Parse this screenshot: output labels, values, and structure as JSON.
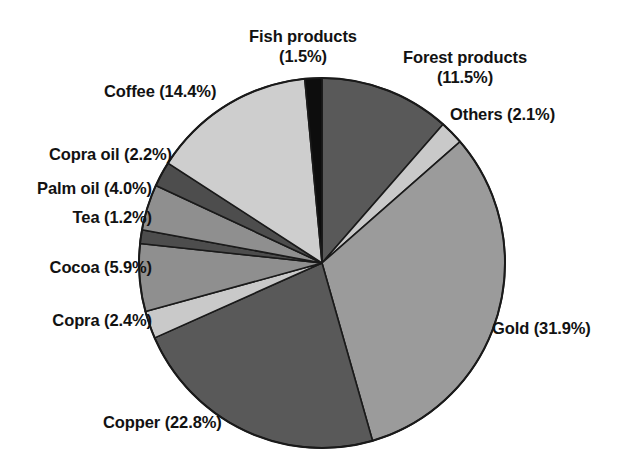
{
  "chart_data": {
    "type": "pie",
    "title": "",
    "subtitle": "",
    "xlabel": "",
    "ylabel": "",
    "legend_position": "none",
    "grid": false,
    "units": "percent",
    "start_angle_deg": 0,
    "direction": "clockwise",
    "categories": [
      "Forest products",
      "Others",
      "Gold",
      "Copper",
      "Copra",
      "Cocoa",
      "Tea",
      "Palm oil",
      "Copra oil",
      "Coffee",
      "Fish products"
    ],
    "values": [
      11.5,
      2.1,
      31.9,
      22.8,
      2.4,
      5.9,
      1.2,
      4.0,
      2.2,
      14.4,
      1.5
    ],
    "slices": [
      {
        "name": "Forest products",
        "value": 11.5,
        "label": "Forest products\n(11.5%)",
        "color": "#595959"
      },
      {
        "name": "Others",
        "value": 2.1,
        "label": "Others (2.1%)",
        "color": "#c9c9c9"
      },
      {
        "name": "Gold",
        "value": 31.9,
        "label": "Gold (31.9%)",
        "color": "#9b9b9b"
      },
      {
        "name": "Copper",
        "value": 22.8,
        "label": "Copper (22.8%)",
        "color": "#595959"
      },
      {
        "name": "Copra",
        "value": 2.4,
        "label": "Copra (2.4%)",
        "color": "#c9c9c9"
      },
      {
        "name": "Cocoa",
        "value": 5.9,
        "label": "Cocoa (5.9%)",
        "color": "#8f8f8f"
      },
      {
        "name": "Tea",
        "value": 1.2,
        "label": "Tea (1.2%)",
        "color": "#4d4d4d"
      },
      {
        "name": "Palm oil",
        "value": 4.0,
        "label": "Palm oil (4.0%)",
        "color": "#8f8f8f"
      },
      {
        "name": "Copra oil",
        "value": 2.2,
        "label": "Copra oil (2.2%)",
        "color": "#4d4d4d"
      },
      {
        "name": "Coffee",
        "value": 14.4,
        "label": "Coffee (14.4%)",
        "color": "#cecece"
      },
      {
        "name": "Fish products",
        "value": 1.5,
        "label": "Fish products\n(1.5%)",
        "color": "#0d0d0d"
      }
    ]
  },
  "labels": {
    "fish_products": "Fish products\n(1.5%)",
    "forest_products": "Forest products\n(11.5%)",
    "others": "Others (2.1%)",
    "gold": "Gold (31.9%)",
    "copper": "Copper (22.8%)",
    "copra": "Copra (2.4%)",
    "cocoa": "Cocoa (5.9%)",
    "tea": "Tea (1.2%)",
    "palm_oil": "Palm oil (4.0%)",
    "copra_oil": "Copra oil (2.2%)",
    "coffee": "Coffee (14.4%)"
  },
  "geometry": {
    "center_x": 322,
    "center_y": 263,
    "radius_x": 183,
    "radius_y": 185
  },
  "colors": {
    "background": "#ffffff",
    "outline": "#1a1a1a",
    "text": "#121212"
  }
}
